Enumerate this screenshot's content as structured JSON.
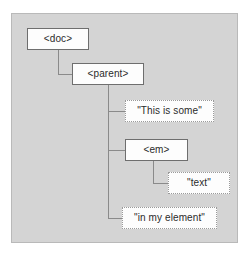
{
  "figure": {
    "name": "dom-tree-diagram",
    "panel_background": "#d4d4d4",
    "panel_border": "#b9b9b9",
    "page_background": "#ffffff",
    "connector_color": "#8a8a8a",
    "element_node_border": "#6e6e6e",
    "text_node_border": "#9a9a9a",
    "node_fill": "#fdfdfd",
    "text_color": "#2b2b2b"
  },
  "nodes": [
    {
      "id": "doc",
      "label": "<doc>",
      "kind": "element",
      "x": 27,
      "y": 28,
      "width": 62,
      "height": 22
    },
    {
      "id": "parent",
      "label": "<parent>",
      "kind": "element",
      "x": 72,
      "y": 63,
      "width": 72,
      "height": 22
    },
    {
      "id": "text1",
      "label": "\"This is some\"",
      "kind": "text",
      "x": 125,
      "y": 100,
      "width": 89,
      "height": 22
    },
    {
      "id": "em",
      "label": "<em>",
      "kind": "element",
      "x": 125,
      "y": 139,
      "width": 63,
      "height": 22
    },
    {
      "id": "text2",
      "label": "\"text\"",
      "kind": "text",
      "x": 168,
      "y": 172,
      "width": 62,
      "height": 22
    },
    {
      "id": "text3",
      "label": "\"in my element\"",
      "kind": "text",
      "x": 122,
      "y": 207,
      "width": 95,
      "height": 22
    }
  ],
  "connectors": [
    {
      "id": "doc-to-parent",
      "from": "doc",
      "to": "parent",
      "points": "58,50 58,74 72,74"
    },
    {
      "id": "parent-trunk",
      "from": "parent",
      "to": "children",
      "points": "108,85 108,218"
    },
    {
      "id": "parent-to-text1",
      "from": "parent",
      "to": "text1",
      "points": "108,111 125,111"
    },
    {
      "id": "parent-to-em",
      "from": "parent",
      "to": "em",
      "points": "108,150 125,150"
    },
    {
      "id": "parent-to-text3",
      "from": "parent",
      "to": "text3",
      "points": "108,218 122,218"
    },
    {
      "id": "em-to-text2",
      "from": "em",
      "to": "text2",
      "points": "153,161 153,183 168,183"
    }
  ]
}
